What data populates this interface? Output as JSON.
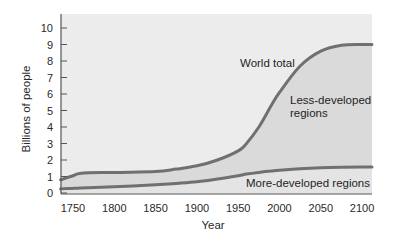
{
  "chart_data": {
    "type": "area",
    "title": "",
    "xlabel": "Year",
    "ylabel": "Billions of people",
    "xlim": [
      1735,
      2112
    ],
    "ylim": [
      0,
      10.5
    ],
    "grid": false,
    "legend": "none (inline annotations)",
    "x_ticks": [
      1750,
      1800,
      1850,
      1900,
      1950,
      2000,
      2050,
      2100
    ],
    "y_ticks": [
      0,
      1,
      2,
      3,
      4,
      5,
      6,
      7,
      8,
      9,
      10
    ],
    "x": [
      1735,
      1750,
      1760,
      1800,
      1850,
      1875,
      1900,
      1925,
      1950,
      1960,
      1975,
      1990,
      2000,
      2025,
      2050,
      2075,
      2100,
      2112
    ],
    "series": [
      {
        "name": "World total",
        "values": [
          0.8,
          1.05,
          1.2,
          1.25,
          1.3,
          1.45,
          1.65,
          2.0,
          2.55,
          3.0,
          4.0,
          5.3,
          6.1,
          7.7,
          8.6,
          8.95,
          9.0,
          9.0
        ]
      },
      {
        "name": "More-developed regions",
        "values": [
          0.25,
          0.28,
          0.3,
          0.38,
          0.5,
          0.58,
          0.68,
          0.85,
          1.05,
          1.15,
          1.25,
          1.33,
          1.38,
          1.47,
          1.53,
          1.56,
          1.57,
          1.57
        ]
      }
    ],
    "regions": [
      {
        "name": "Less-developed regions",
        "between": [
          "More-developed regions",
          "World total"
        ]
      },
      {
        "name": "More-developed regions",
        "between": [
          "axis",
          "More-developed regions"
        ]
      }
    ],
    "annotations": [
      {
        "text": "World total",
        "x": 2005,
        "y": 7.9
      },
      {
        "text": "Less-developed regions",
        "x": 2055,
        "y": 5.6
      },
      {
        "text": "More-developed regions",
        "x": 2040,
        "y": 0.45
      }
    ]
  },
  "labels": {
    "world_total": "World total",
    "less_dev_1": "Less-developed",
    "less_dev_2": "regions",
    "more_dev": "More-developed regions",
    "xlabel": "Year",
    "ylabel": "Billions of people"
  },
  "colors": {
    "plot_bg": "#ececec",
    "fill_between": "#dadada",
    "fill_lower": "#e4e4e4",
    "curve": "#707070",
    "axis": "#555555"
  }
}
